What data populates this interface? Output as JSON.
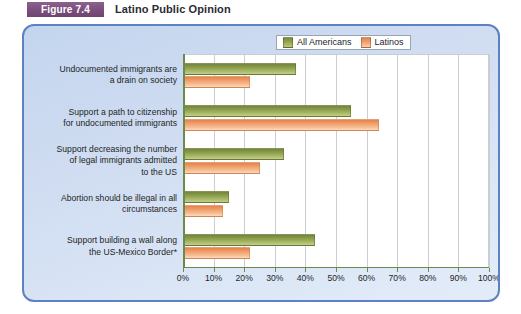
{
  "header": {
    "figure_label": "Figure 7.4",
    "title": "Latino Public Opinion"
  },
  "legend": {
    "position": "top-center",
    "items": [
      {
        "label": "All Americans",
        "color": "#93a553"
      },
      {
        "label": "Latinos",
        "color": "#f0a071"
      }
    ]
  },
  "axis": {
    "ticks": [
      "0%",
      "10%",
      "20%",
      "30%",
      "40%",
      "50%",
      "60%",
      "70%",
      "80%",
      "90%",
      "100%"
    ]
  },
  "categories_lines": [
    [
      "Undocumented immigrants are",
      "a drain on society"
    ],
    [
      "Support a path to citizenship",
      "for undocumented immigrants"
    ],
    [
      "Support decreasing the number",
      "of legal immigrants admitted",
      "to the US"
    ],
    [
      "Abortion should be illegal in all",
      "circumstances"
    ],
    [
      "Support building a wall along",
      "the US-Mexico Border*"
    ]
  ],
  "chart_data": {
    "type": "bar",
    "orientation": "horizontal",
    "title": "Latino Public Opinion",
    "xlabel": "",
    "ylabel": "",
    "xlim": [
      0,
      100
    ],
    "xticks": [
      0,
      10,
      20,
      30,
      40,
      50,
      60,
      70,
      80,
      90,
      100
    ],
    "grid": true,
    "legend_position": "top-center",
    "categories": [
      "Undocumented immigrants are a drain on society",
      "Support a path to citizenship for undocumented immigrants",
      "Support decreasing the number of legal immigrants admitted to the US",
      "Abortion should be illegal in all circumstances",
      "Support building a wall along the US-Mexico Border*"
    ],
    "series": [
      {
        "name": "All Americans",
        "color": "#93a553",
        "values": [
          37,
          55,
          33,
          15,
          43
        ]
      },
      {
        "name": "Latinos",
        "color": "#f0a071",
        "values": [
          22,
          64,
          25,
          13,
          22
        ]
      }
    ]
  }
}
